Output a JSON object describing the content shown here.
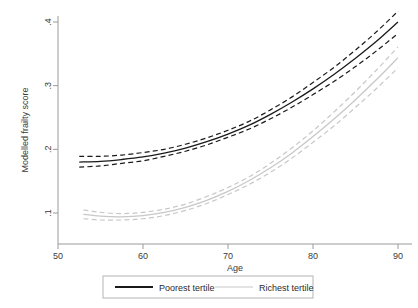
{
  "chart_data": {
    "type": "line",
    "title": "",
    "subtitle": "",
    "xlabel": "Age",
    "ylabel": "Modelled frailty score",
    "xlim": [
      50,
      90
    ],
    "ylim": [
      0.06,
      0.4
    ],
    "grid": false,
    "legend_position": "bottom",
    "x_ticks": [
      50,
      60,
      70,
      80,
      90
    ],
    "x_tick_labels": [
      "50",
      "60",
      "70",
      "80",
      "90"
    ],
    "y_ticks": [
      0.1,
      0.2,
      0.3,
      0.4
    ],
    "y_tick_labels": [
      ".1",
      ".2",
      ".3",
      ".4"
    ],
    "series": [
      {
        "name": "Poorest tertile",
        "color": "#1a1a1a",
        "style": "solid",
        "x": [
          52.5,
          55,
          57.5,
          60,
          62.5,
          65,
          67.5,
          70,
          72.5,
          75,
          77.5,
          80,
          82.5,
          85,
          87.5,
          90
        ],
        "values": [
          0.18,
          0.181,
          0.184,
          0.188,
          0.194,
          0.202,
          0.212,
          0.224,
          0.238,
          0.255,
          0.274,
          0.295,
          0.318,
          0.343,
          0.37,
          0.4
        ],
        "ci_lower": [
          0.172,
          0.174,
          0.178,
          0.182,
          0.189,
          0.197,
          0.207,
          0.219,
          0.232,
          0.248,
          0.266,
          0.286,
          0.307,
          0.33,
          0.355,
          0.382
        ],
        "ci_upper": [
          0.189,
          0.189,
          0.191,
          0.195,
          0.2,
          0.208,
          0.218,
          0.23,
          0.244,
          0.262,
          0.282,
          0.305,
          0.329,
          0.356,
          0.385,
          0.417
        ]
      },
      {
        "name": "Richest tertile",
        "color": "#c8c8c8",
        "style": "solid",
        "x": [
          53,
          55,
          57.5,
          60,
          62.5,
          65,
          67.5,
          70,
          72.5,
          75,
          77.5,
          80,
          82.5,
          85,
          87.5,
          90
        ],
        "values": [
          0.098,
          0.095,
          0.094,
          0.096,
          0.101,
          0.109,
          0.12,
          0.134,
          0.151,
          0.171,
          0.194,
          0.22,
          0.248,
          0.278,
          0.31,
          0.344
        ],
        "ci_lower": [
          0.091,
          0.089,
          0.089,
          0.091,
          0.096,
          0.104,
          0.115,
          0.129,
          0.145,
          0.164,
          0.186,
          0.211,
          0.237,
          0.266,
          0.296,
          0.328
        ],
        "ci_upper": [
          0.105,
          0.101,
          0.099,
          0.101,
          0.106,
          0.114,
          0.126,
          0.14,
          0.157,
          0.178,
          0.202,
          0.229,
          0.259,
          0.291,
          0.325,
          0.361
        ]
      }
    ],
    "legend": [
      {
        "label": "Poorest tertile",
        "color": "#1a1a1a"
      },
      {
        "label": "Richest tertile",
        "color": "#c8c8c8"
      }
    ]
  }
}
